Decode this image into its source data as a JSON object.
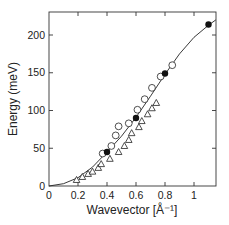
{
  "chart_data": {
    "type": "scatter",
    "title": "",
    "xlabel": "Wavevector [Å⁻¹]",
    "ylabel": "Energy (meV)",
    "xlim": [
      0,
      1.15
    ],
    "ylim": [
      0,
      230
    ],
    "xticks": [
      0,
      0.2,
      0.4,
      0.6,
      0.8,
      1
    ],
    "xtick_labels": [
      "0",
      "0.2",
      "0.4",
      "0.6",
      "0.8",
      "1"
    ],
    "yticks": [
      0,
      50,
      100,
      150,
      200
    ],
    "ytick_labels": [
      "0",
      "50",
      "100",
      "150",
      "200"
    ],
    "grid": false,
    "legend": null,
    "series": [
      {
        "name": "filled circles",
        "marker": "filled-circle",
        "x": [
          0.4,
          0.6,
          0.8,
          1.1
        ],
        "y": [
          45,
          90,
          149,
          214
        ]
      },
      {
        "name": "open circles",
        "marker": "open-circle",
        "x": [
          0.37,
          0.43,
          0.46,
          0.48,
          0.55,
          0.61,
          0.66,
          0.71,
          0.77,
          0.85
        ],
        "y": [
          43,
          53,
          67,
          79,
          83,
          101,
          115,
          130,
          145,
          160
        ]
      },
      {
        "name": "open triangles",
        "marker": "open-triangle",
        "x": [
          0.19,
          0.23,
          0.27,
          0.3,
          0.34,
          0.36,
          0.42,
          0.48,
          0.52,
          0.55,
          0.57,
          0.62,
          0.64,
          0.68,
          0.71,
          0.74
        ],
        "y": [
          8,
          12,
          16,
          19,
          24,
          29,
          36,
          45,
          53,
          61,
          70,
          78,
          86,
          95,
          103,
          110
        ]
      },
      {
        "name": "fit curve",
        "marker": "line",
        "x": [
          0,
          0.1,
          0.2,
          0.3,
          0.4,
          0.5,
          0.6,
          0.7,
          0.8,
          0.9,
          1.0,
          1.1,
          1.15
        ],
        "y": [
          0,
          3,
          11,
          25,
          45,
          66,
          91,
          119,
          148,
          175,
          197,
          213,
          220
        ]
      }
    ]
  }
}
